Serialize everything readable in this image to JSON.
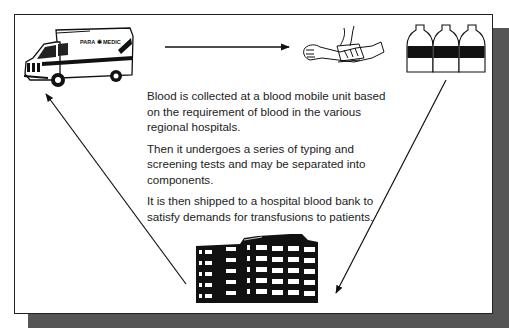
{
  "diagram": {
    "type": "cycle",
    "title": "",
    "nodes": [
      {
        "id": "ambulance",
        "label": "Blood mobile unit (ambulance)",
        "icon": "ambulance-icon",
        "vehicle_text": "PARA ✱ MEDIC"
      },
      {
        "id": "collection",
        "label": "Blood collection (arm with tourniquet)",
        "icon": "blood-draw-icon"
      },
      {
        "id": "bottles",
        "label": "Blood bottles / components",
        "icon": "blood-bottles-icon",
        "count": 3
      },
      {
        "id": "hospital",
        "label": "Hospital",
        "icon": "hospital-building-icon"
      }
    ],
    "edges": [
      {
        "from": "ambulance",
        "to": "collection"
      },
      {
        "from": "bottles",
        "to": "hospital"
      },
      {
        "from": "hospital",
        "to": "ambulance"
      }
    ]
  },
  "text": {
    "paragraphs": [
      "Blood is collected at a blood mobile unit based on the requirement of blood in the various regional hospitals.",
      "Then it undergoes a series of typing and screening tests and may be separated into components.",
      "It is then shipped to a hospital blood bank to satisfy demands for transfusions to patients."
    ]
  },
  "colors": {
    "border": "#222222",
    "shadow": "#555555",
    "ink": "#111111",
    "background": "#ffffff"
  }
}
